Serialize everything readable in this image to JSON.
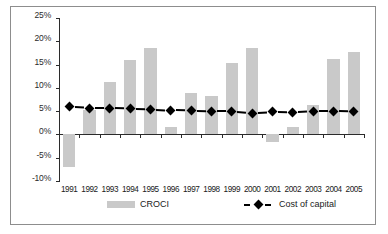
{
  "chart_data": {
    "type": "bar",
    "title": "",
    "subtitle": "",
    "xlabel": "",
    "ylabel": "",
    "categories": [
      "1991",
      "1992",
      "1993",
      "1994",
      "1995",
      "1996",
      "1997",
      "1998",
      "1999",
      "2000",
      "2001",
      "2002",
      "2003",
      "2004",
      "2005"
    ],
    "ylim": [
      -10,
      25
    ],
    "ytick_labels": [
      "25%",
      "20%",
      "15%",
      "10%",
      "5%",
      "0%",
      "-5%",
      "-10%"
    ],
    "ytick_values": [
      25,
      20,
      15,
      10,
      5,
      0,
      -5,
      -10
    ],
    "grid": false,
    "legend_position": "bottom",
    "series": [
      {
        "name": "CROCI",
        "type": "bar",
        "color": "#c9c9c9",
        "values": [
          -7.0,
          5.3,
          11.2,
          16.0,
          18.6,
          1.7,
          9.0,
          8.3,
          15.3,
          18.6,
          -1.7,
          1.7,
          6.3,
          16.3,
          17.8
        ]
      },
      {
        "name": "Cost of capital",
        "type": "line",
        "color": "#000000",
        "marker": "diamond",
        "linestyle": "dashed",
        "values": [
          5.9,
          5.6,
          5.6,
          5.5,
          5.4,
          5.2,
          5.1,
          5.0,
          5.0,
          4.6,
          4.9,
          4.8,
          5.0,
          5.0,
          4.9
        ]
      }
    ]
  },
  "legend": {
    "items": [
      {
        "label": "CROCI",
        "marker": "swatch-bar",
        "color": "#c9c9c9"
      },
      {
        "label": "Cost of capital",
        "marker": "dashed-diamond",
        "color": "#000000"
      }
    ]
  },
  "colors": {
    "bar_fill": "#c9c9c9",
    "axis": "#2b2b2b",
    "series_line": "#000000",
    "frame": "#8d8d8d",
    "background": "#ffffff"
  }
}
